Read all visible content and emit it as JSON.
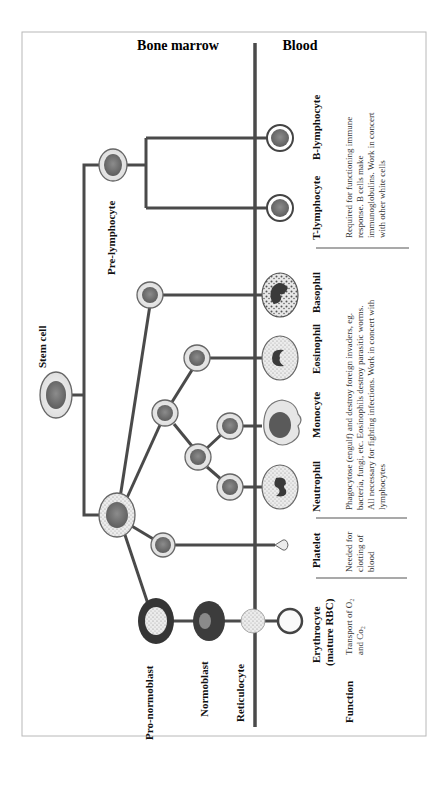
{
  "header": {
    "left": "Bone marrow",
    "right": "Blood"
  },
  "progenitors": {
    "stem_cell": "Stem cell",
    "pre_lymphocyte": "Pre-lymphocyte",
    "pro_normoblast": "Pro-normoblast",
    "normoblast": "Normoblast",
    "reticulocyte": "Reticulocyte"
  },
  "mature_cells": [
    {
      "id": "b_lymphocyte",
      "label": "B-lymphocyte"
    },
    {
      "id": "t_lymphocyte",
      "label": "T-lymphocyte"
    },
    {
      "id": "basophil",
      "label": "Basophil"
    },
    {
      "id": "eosinophil",
      "label": "Eosinophil"
    },
    {
      "id": "monocyte",
      "label": "Monocyte"
    },
    {
      "id": "neutrophil",
      "label": "Neutrophil"
    },
    {
      "id": "platelet",
      "label": "Platelet"
    },
    {
      "id": "erythrocyte",
      "label_line1": "Erythrocyte",
      "label_line2": "(mature RBC)"
    }
  ],
  "function_label": "Function",
  "functions": {
    "lymphocytes": [
      "Required for functioning immune",
      "response. B cells make",
      "immunoglobulins. Work in concert",
      "with other white cells"
    ],
    "granulocytes_monocytes": [
      "Phagocytose (engulf) and destroy foreign invaders, eg.",
      "bacteria, fungi, etc. Eosinophils destroy parasitic worms.",
      "All necessary for fighting infections. Work in concert with",
      "lymphocytes"
    ],
    "platelet": [
      "Needed for",
      "clotting of",
      "blood"
    ],
    "erythrocyte": [
      "Transport of O₂",
      "and Co₂"
    ]
  },
  "colors": {
    "line": "#4a4a4a",
    "nucleus": "#707070",
    "cytoplasm_light": "#efefef",
    "erythroid_dark": "#3a3a3a",
    "frame": "#b8b8b8"
  }
}
